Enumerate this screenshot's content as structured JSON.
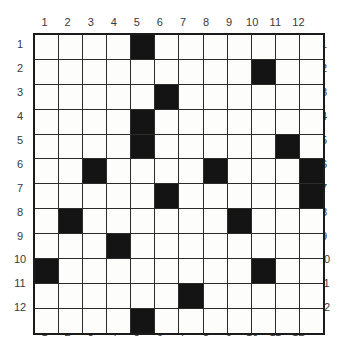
{
  "puzzle": {
    "type": "filled-cell-grid",
    "rows": 12,
    "columns": 12,
    "row_labels": [
      "1",
      "2",
      "3",
      "4",
      "5",
      "6",
      "7",
      "8",
      "9",
      "10",
      "11",
      "12"
    ],
    "column_labels": [
      "1",
      "2",
      "3",
      "4",
      "5",
      "6",
      "7",
      "8",
      "9",
      "10",
      "11",
      "12"
    ],
    "colors": {
      "filled_cell": "#141414",
      "empty_cell": "#fdfdfb",
      "grid_line": "#2b2b2b",
      "border": "#1b1b1b",
      "label_text": "#39393b",
      "background": "#ffffff"
    },
    "filled_count": 19,
    "filled_cells_by_row": [
      {
        "row": 1,
        "columns": [
          5
        ]
      },
      {
        "row": 2,
        "columns": [
          10
        ]
      },
      {
        "row": 3,
        "columns": [
          6
        ]
      },
      {
        "row": 4,
        "columns": [
          5
        ]
      },
      {
        "row": 5,
        "columns": [
          5,
          11
        ]
      },
      {
        "row": 6,
        "columns": [
          3,
          8,
          12
        ]
      },
      {
        "row": 7,
        "columns": [
          6,
          12
        ]
      },
      {
        "row": 8,
        "columns": [
          2,
          9
        ]
      },
      {
        "row": 9,
        "columns": [
          4
        ]
      },
      {
        "row": 10,
        "columns": [
          1,
          10
        ]
      },
      {
        "row": 11,
        "columns": [
          7
        ]
      },
      {
        "row": 12,
        "columns": [
          5
        ]
      }
    ],
    "matrix": [
      [
        0,
        0,
        0,
        0,
        1,
        0,
        0,
        0,
        0,
        0,
        0,
        0
      ],
      [
        0,
        0,
        0,
        0,
        0,
        0,
        0,
        0,
        0,
        1,
        0,
        0
      ],
      [
        0,
        0,
        0,
        0,
        0,
        1,
        0,
        0,
        0,
        0,
        0,
        0
      ],
      [
        0,
        0,
        0,
        0,
        1,
        0,
        0,
        0,
        0,
        0,
        0,
        0
      ],
      [
        0,
        0,
        0,
        0,
        1,
        0,
        0,
        0,
        0,
        0,
        1,
        0
      ],
      [
        0,
        0,
        1,
        0,
        0,
        0,
        0,
        1,
        0,
        0,
        0,
        1
      ],
      [
        0,
        0,
        0,
        0,
        0,
        1,
        0,
        0,
        0,
        0,
        0,
        1
      ],
      [
        0,
        1,
        0,
        0,
        0,
        0,
        0,
        0,
        1,
        0,
        0,
        0
      ],
      [
        0,
        0,
        0,
        1,
        0,
        0,
        0,
        0,
        0,
        0,
        0,
        0
      ],
      [
        1,
        0,
        0,
        0,
        0,
        0,
        0,
        0,
        0,
        1,
        0,
        0
      ],
      [
        0,
        0,
        0,
        0,
        0,
        0,
        1,
        0,
        0,
        0,
        0,
        0
      ],
      [
        0,
        0,
        0,
        0,
        1,
        0,
        0,
        0,
        0,
        0,
        0,
        0
      ]
    ]
  }
}
